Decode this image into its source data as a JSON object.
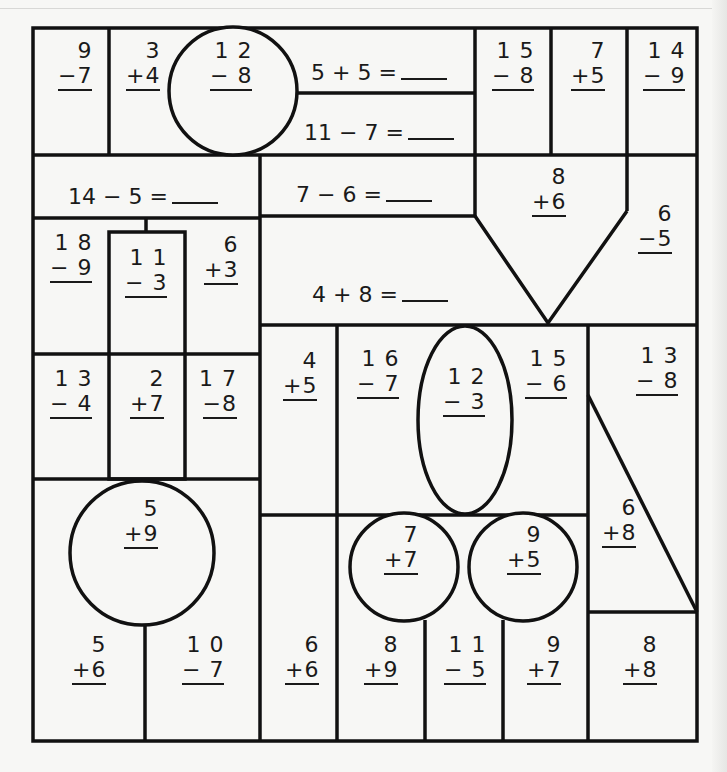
{
  "worksheet": {
    "line_color": "#111111",
    "vertical_problems": [
      {
        "id": "p1",
        "top": "9",
        "bottom": "−7"
      },
      {
        "id": "p2",
        "top": "3",
        "bottom": "+4"
      },
      {
        "id": "p3",
        "top": "1 2",
        "bottom": "− 8"
      },
      {
        "id": "p4",
        "top": "1 5",
        "bottom": "− 8"
      },
      {
        "id": "p5",
        "top": "7",
        "bottom": "+5"
      },
      {
        "id": "p6",
        "top": "1 4",
        "bottom": "− 9"
      },
      {
        "id": "p7",
        "top": "8",
        "bottom": "+6"
      },
      {
        "id": "p8",
        "top": "6",
        "bottom": "−5"
      },
      {
        "id": "p9",
        "top": "1 8",
        "bottom": "− 9"
      },
      {
        "id": "p10",
        "top": "1 1",
        "bottom": "− 3"
      },
      {
        "id": "p11",
        "top": "6",
        "bottom": "+3"
      },
      {
        "id": "p12",
        "top": "1 3",
        "bottom": "− 4"
      },
      {
        "id": "p13",
        "top": "2",
        "bottom": "+7"
      },
      {
        "id": "p14",
        "top": "1 7",
        "bottom": "−8"
      },
      {
        "id": "p15",
        "top": "4",
        "bottom": "+5"
      },
      {
        "id": "p16",
        "top": "1 6",
        "bottom": "− 7"
      },
      {
        "id": "p17",
        "top": "1 2",
        "bottom": "− 3"
      },
      {
        "id": "p18",
        "top": "1 5",
        "bottom": "− 6"
      },
      {
        "id": "p19",
        "top": "1 3",
        "bottom": "− 8"
      },
      {
        "id": "p20",
        "top": "5",
        "bottom": "+9"
      },
      {
        "id": "p21",
        "top": "6",
        "bottom": "+8"
      },
      {
        "id": "p22",
        "top": "7",
        "bottom": "+7"
      },
      {
        "id": "p23",
        "top": "9",
        "bottom": "+5"
      },
      {
        "id": "p24",
        "top": "5",
        "bottom": "+6"
      },
      {
        "id": "p25",
        "top": "1 0",
        "bottom": "− 7"
      },
      {
        "id": "p26",
        "top": "6",
        "bottom": "+6"
      },
      {
        "id": "p27",
        "top": "8",
        "bottom": "+9"
      },
      {
        "id": "p28",
        "top": "1 1",
        "bottom": "− 5"
      },
      {
        "id": "p29",
        "top": "9",
        "bottom": "+7"
      },
      {
        "id": "p30",
        "top": "8",
        "bottom": "+8"
      }
    ],
    "horizontal_problems": [
      {
        "id": "h1",
        "text": "5 + 5 ="
      },
      {
        "id": "h2",
        "text": "11 − 7 ="
      },
      {
        "id": "h3",
        "text": "14 − 5 ="
      },
      {
        "id": "h4",
        "text": "7 − 6 ="
      },
      {
        "id": "h5",
        "text": "4 + 8 ="
      }
    ]
  }
}
